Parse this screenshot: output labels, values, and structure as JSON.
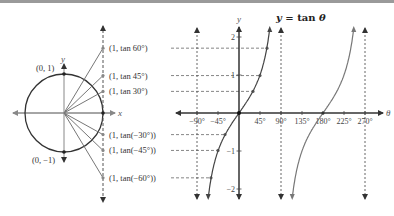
{
  "title": "y = tan θ",
  "title_parts": {
    "y": "y",
    "eq": " = tan ",
    "theta": "θ"
  },
  "unit_circle": {
    "center": [
      64,
      113
    ],
    "radius": 39,
    "tangent_x": 103,
    "axis_labels": {
      "x": "x",
      "y": "y"
    },
    "top_point_label": "(0, 1)",
    "bottom_point_label": "(0, −1)",
    "tangent_points": [
      {
        "angle": 60,
        "label": "(1, tan 60°)"
      },
      {
        "angle": 45,
        "label": "(1, tan 45°)"
      },
      {
        "angle": 30,
        "label": "(1, tan 30°)"
      },
      {
        "angle": -30,
        "label": "(1, tan(−30°))"
      },
      {
        "angle": -45,
        "label": "(1, tan(−45°))"
      },
      {
        "angle": -60,
        "label": "(1, tan(−60°))"
      }
    ]
  },
  "graph": {
    "origin": [
      239,
      113
    ],
    "px_per_45deg": 21,
    "px_per_unit": 38,
    "x_label": "θ",
    "y_label": "y",
    "x_ticks": [
      "−90°",
      "−45°",
      "45°",
      "90°",
      "135°",
      "180°",
      "225°",
      "270°"
    ],
    "x_tick_values": [
      -90,
      -45,
      45,
      90,
      135,
      180,
      225,
      270
    ],
    "y_ticks": [
      "2",
      "1",
      "−1",
      "−2"
    ],
    "y_tick_values": [
      2,
      1,
      -1,
      -2
    ],
    "asymptotes_deg": [
      -90,
      90,
      270
    ],
    "colors": {
      "axis": "#333333",
      "curve1": "#444444",
      "curve2": "#777777",
      "dash": "#555555",
      "circle": "#333333",
      "ray": "#777777"
    }
  },
  "chart_data": {
    "type": "line",
    "title": "y = tan θ",
    "xlabel": "θ",
    "ylabel": "y",
    "xlim": [
      -90,
      270
    ],
    "ylim": [
      -2.2,
      2.2
    ],
    "x_ticks": [
      -90,
      -45,
      45,
      90,
      135,
      180,
      225,
      270
    ],
    "y_ticks": [
      -2,
      -1,
      1,
      2
    ],
    "asymptotes": [
      -90,
      90,
      270
    ],
    "series": [
      {
        "name": "tan θ, branch (−90°, 90°)",
        "x": [
          -60,
          -45,
          -30,
          0,
          30,
          45,
          60
        ],
        "y": [
          -1.732,
          -1,
          -0.577,
          0,
          0.577,
          1,
          1.732
        ]
      },
      {
        "name": "tan θ, branch (90°, 270°)",
        "x": [
          120,
          135,
          150,
          180,
          210,
          225,
          240
        ],
        "y": [
          -1.732,
          -1,
          -0.577,
          0,
          0.577,
          1,
          1.732
        ]
      }
    ],
    "marked_points": [
      {
        "theta": 60,
        "y": 1.732
      },
      {
        "theta": 45,
        "y": 1
      },
      {
        "theta": 30,
        "y": 0.577
      },
      {
        "theta": 0,
        "y": 0
      },
      {
        "theta": -30,
        "y": -0.577
      },
      {
        "theta": -45,
        "y": -1
      },
      {
        "theta": -60,
        "y": -1.732
      }
    ],
    "grid": false
  }
}
